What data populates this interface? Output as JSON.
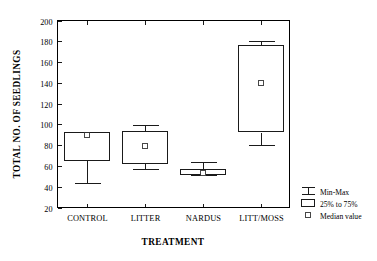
{
  "chart_data": {
    "type": "box",
    "title": "",
    "xlabel": "TREATMENT",
    "ylabel": "TOTAL NO. OF SEEDLINGS",
    "ylim": [
      20,
      200
    ],
    "yticks": [
      20,
      40,
      60,
      80,
      100,
      120,
      140,
      160,
      180,
      200
    ],
    "ytick_labels": [
      "20",
      "40",
      "60",
      "80",
      "100",
      "120",
      "140",
      "160",
      "180",
      "200"
    ],
    "grid": false,
    "categories": [
      "CONTROL",
      "LITTER",
      "NARDUS",
      "LITT/MOSS"
    ],
    "boxes": [
      {
        "category": "CONTROL",
        "min": 44,
        "q1": 66,
        "median": 90,
        "q3": 93,
        "max": 93,
        "show_upper_whisker": false
      },
      {
        "category": "LITTER",
        "min": 57,
        "q1": 63,
        "median": 80,
        "q3": 94,
        "max": 99,
        "show_upper_whisker": true
      },
      {
        "category": "NARDUS",
        "min": 51,
        "q1": 52,
        "median": 54,
        "q3": 57,
        "max": 64,
        "show_upper_whisker": true
      },
      {
        "category": "LITT/MOSS",
        "min": 80,
        "q1": 93,
        "median": 140,
        "q3": 176,
        "max": 180,
        "show_upper_whisker": true
      }
    ],
    "legend": {
      "position": "right-bottom",
      "entries": [
        {
          "key": "min-max",
          "label": "Min-Max",
          "symbol": "whisker-icon"
        },
        {
          "key": "iqr",
          "label": "25% to 75%",
          "symbol": "box-icon"
        },
        {
          "key": "median",
          "label": "Median value",
          "symbol": "median-square-icon"
        }
      ]
    },
    "colors": {
      "line": "#1a1a1a",
      "axis": "#000000",
      "background": "#ffffff",
      "box_fill": "#ffffff"
    }
  }
}
